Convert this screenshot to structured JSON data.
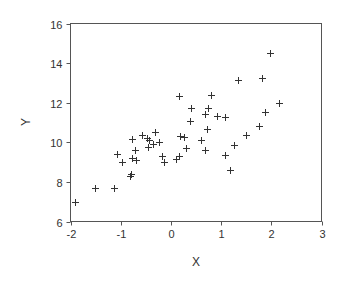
{
  "chart_data": {
    "type": "scatter",
    "title": "",
    "xlabel": "X",
    "ylabel": "Y",
    "xlim": [
      -2,
      3
    ],
    "ylim": [
      6,
      16
    ],
    "xticks": [
      -2,
      -1,
      0,
      1,
      2,
      3
    ],
    "yticks": [
      6,
      8,
      10,
      12,
      14,
      16
    ],
    "grid": false,
    "legend": null,
    "marker": "+",
    "series": [
      {
        "name": "Y vs X",
        "points": [
          [
            -1.91,
            7.01
          ],
          [
            -1.51,
            7.67
          ],
          [
            -1.14,
            7.71
          ],
          [
            -1.08,
            9.43
          ],
          [
            -0.98,
            9.03
          ],
          [
            -0.8,
            8.39
          ],
          [
            -0.82,
            8.29
          ],
          [
            -0.78,
            9.2
          ],
          [
            -0.7,
            9.11
          ],
          [
            -0.72,
            9.62
          ],
          [
            -0.77,
            10.15
          ],
          [
            -0.58,
            10.35
          ],
          [
            -0.47,
            10.22
          ],
          [
            -0.43,
            10.12
          ],
          [
            -0.31,
            10.54
          ],
          [
            -0.23,
            10.0
          ],
          [
            -0.35,
            9.91
          ],
          [
            -0.46,
            9.78
          ],
          [
            -0.17,
            9.29
          ],
          [
            -0.14,
            9.02
          ],
          [
            0.11,
            9.14
          ],
          [
            0.16,
            9.32
          ],
          [
            0.16,
            12.36
          ],
          [
            0.8,
            12.39
          ],
          [
            0.4,
            11.71
          ],
          [
            0.73,
            11.74
          ],
          [
            0.67,
            11.44
          ],
          [
            0.92,
            11.31
          ],
          [
            1.08,
            11.3
          ],
          [
            0.38,
            11.09
          ],
          [
            0.71,
            10.69
          ],
          [
            0.18,
            10.3
          ],
          [
            0.27,
            10.28
          ],
          [
            0.6,
            10.13
          ],
          [
            0.3,
            9.73
          ],
          [
            0.68,
            9.63
          ],
          [
            1.25,
            9.86
          ],
          [
            1.07,
            9.36
          ],
          [
            1.17,
            8.6
          ],
          [
            1.33,
            13.16
          ],
          [
            1.81,
            13.27
          ],
          [
            1.97,
            14.52
          ],
          [
            2.16,
            11.96
          ],
          [
            1.87,
            11.52
          ],
          [
            1.75,
            10.83
          ],
          [
            1.49,
            10.39
          ]
        ]
      }
    ]
  },
  "labels": {
    "x_axis_title": "X",
    "y_axis_title": "Y",
    "x_tick_labels": [
      "-2",
      "-1",
      "0",
      "1",
      "2",
      "3"
    ],
    "y_tick_labels": [
      "6",
      "8",
      "10",
      "12",
      "14",
      "16"
    ]
  },
  "colors": {
    "axis": "#555555",
    "marker": "#333333",
    "background": "#ffffff"
  }
}
